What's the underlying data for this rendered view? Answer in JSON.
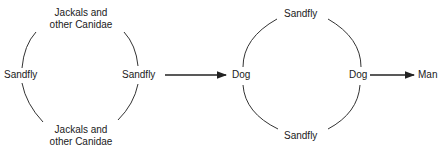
{
  "left_cycle": {
    "top_label_line1": "Jackals and",
    "top_label_line2": "other Canidae",
    "bottom_label_line1": "Jackals and",
    "bottom_label_line2": "other Canidae",
    "left_label": "Sandfly",
    "right_label": "Sandfly"
  },
  "right_cycle": {
    "top_label": "Sandfly",
    "bottom_label": "Sandfly",
    "left_label": "Dog",
    "right_label": "Dog"
  },
  "final_target": "Man",
  "colors": {
    "line": "#333333",
    "text": "#1a1a1a",
    "background": "#ffffff"
  }
}
